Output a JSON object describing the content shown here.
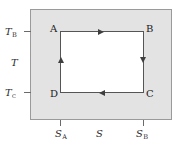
{
  "figure": {
    "type": "thermodynamic-cycle-diagram",
    "colors": {
      "plane_fill": "#e3e3e3",
      "plane_border": "#9a9a9a",
      "cycle_fill": "#ffffff",
      "cycle_stroke": "#555555",
      "arrow": "#3f3f3f",
      "text": "#1b1b1b",
      "tick": "#6a6a6a",
      "background": "#ffffff"
    }
  },
  "axes": {
    "y": {
      "name": "T",
      "label": "T",
      "ticks": [
        {
          "id": "T-hot",
          "label": "T",
          "subscript": "B"
        },
        {
          "id": "T-cold",
          "label": "T",
          "subscript": "c"
        }
      ]
    },
    "x": {
      "name": "S",
      "label": "S",
      "ticks": [
        {
          "id": "S-A",
          "label": "S",
          "subscript": "A"
        },
        {
          "id": "S-B",
          "label": "S",
          "subscript": "B"
        }
      ]
    }
  },
  "vertices": [
    {
      "id": "A",
      "label": "A",
      "position": "top-left"
    },
    {
      "id": "B",
      "label": "B",
      "position": "top-right"
    },
    {
      "id": "C",
      "label": "C",
      "position": "bottom-right"
    },
    {
      "id": "D",
      "label": "D",
      "position": "bottom-left"
    }
  ],
  "process_arrows": [
    {
      "id": "A-to-B",
      "edge": "top",
      "direction": "right"
    },
    {
      "id": "B-to-C",
      "edge": "right",
      "direction": "down"
    },
    {
      "id": "C-to-D",
      "edge": "bottom",
      "direction": "left"
    },
    {
      "id": "D-to-A",
      "edge": "left",
      "direction": "up"
    }
  ],
  "chart_data": {
    "type": "line",
    "title": "",
    "xlabel": "S",
    "ylabel": "T",
    "grid": false,
    "legend": "none",
    "xlim": [
      0,
      1
    ],
    "ylim": [
      0,
      1
    ],
    "xticklabels": [
      "S_A",
      "S_B"
    ],
    "yticklabels": [
      "T_B",
      "T_c"
    ],
    "series": [
      {
        "name": "Carnot cycle",
        "closed": true,
        "points": [
          {
            "label": "A",
            "S": "S_A",
            "T": "T_B"
          },
          {
            "label": "B",
            "S": "S_B",
            "T": "T_B"
          },
          {
            "label": "C",
            "S": "S_B",
            "T": "T_c"
          },
          {
            "label": "D",
            "S": "S_A",
            "T": "T_c"
          }
        ]
      }
    ]
  }
}
